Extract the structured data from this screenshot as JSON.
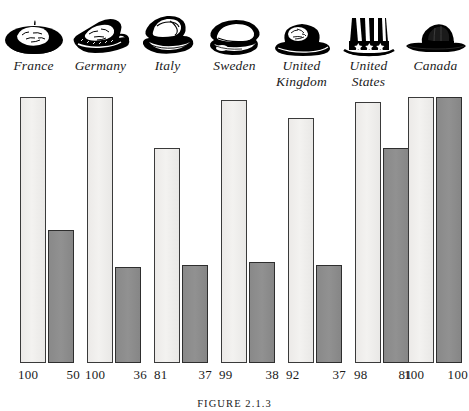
{
  "figure": {
    "caption": "FIGURE 2.1.3",
    "background_color": "#ffffff",
    "light_bar_color": "#efefed",
    "dark_bar_color": "#8c8c8c",
    "outline_color": "#3a3a3a"
  },
  "chart_data": {
    "type": "bar",
    "title": "",
    "subtitle": "",
    "xlabel": "",
    "ylabel": "",
    "ylim": [
      0,
      100
    ],
    "grid": false,
    "legend_position": "none",
    "categories": [
      "France",
      "Germany",
      "Italy",
      "Sweden",
      "United Kingdom",
      "United States",
      "Canada"
    ],
    "series": [
      {
        "name": "light",
        "values": [
          100,
          100,
          81,
          99,
          92,
          98,
          100
        ]
      },
      {
        "name": "dark",
        "values": [
          50,
          36,
          37,
          38,
          37,
          81,
          100
        ]
      }
    ],
    "annotations": [
      "100",
      "50",
      "100",
      "36",
      "81",
      "37",
      "99",
      "38",
      "92",
      "37",
      "98",
      "81",
      "100",
      "100"
    ]
  },
  "groups": [
    {
      "country": "France",
      "line1": "France",
      "line2": "",
      "icon": "beret-hat-icon",
      "light_value": 100,
      "dark_value": 50,
      "light_label": "100",
      "dark_label": "50"
    },
    {
      "country": "Germany",
      "line1": "Germany",
      "line2": "",
      "icon": "tyrolean-hat-icon",
      "light_value": 100,
      "dark_value": 36,
      "light_label": "100",
      "dark_label": "36"
    },
    {
      "country": "Italy",
      "line1": "Italy",
      "line2": "",
      "icon": "fedora-hat-icon",
      "light_value": 81,
      "dark_value": 37,
      "light_label": "81",
      "dark_label": "37"
    },
    {
      "country": "Sweden",
      "line1": "Sweden",
      "line2": "",
      "icon": "flat-cap-icon",
      "light_value": 99,
      "dark_value": 38,
      "light_label": "99",
      "dark_label": "38"
    },
    {
      "country": "United Kingdom",
      "line1": "United",
      "line2": "Kingdom",
      "icon": "bowler-hat-icon",
      "light_value": 92,
      "dark_value": 37,
      "light_label": "92",
      "dark_label": "37"
    },
    {
      "country": "United States",
      "line1": "United",
      "line2": "States",
      "icon": "uncle-sam-top-hat-icon",
      "light_value": 98,
      "dark_value": 81,
      "light_label": "98",
      "dark_label": "81"
    },
    {
      "country": "Canada",
      "line1": "Canada",
      "line2": "",
      "icon": "mountie-hat-icon",
      "light_value": 100,
      "dark_value": 100,
      "light_label": "100",
      "dark_label": "100"
    }
  ]
}
